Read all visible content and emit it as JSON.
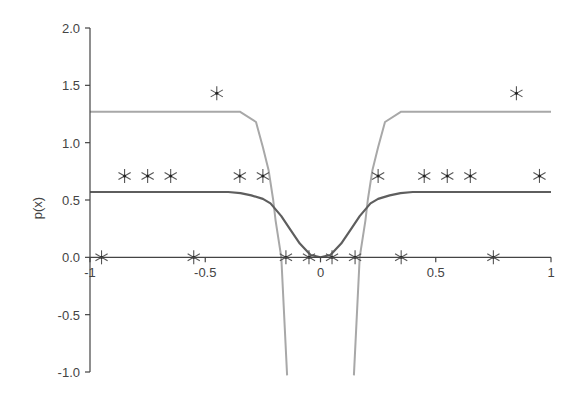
{
  "chart_data": {
    "type": "line",
    "title": "",
    "xlabel": "",
    "ylabel": "p(x)",
    "xlim": [
      -1,
      1
    ],
    "ylim": [
      -1,
      2
    ],
    "x_ticks": [
      -1,
      -0.5,
      0,
      0.5,
      1
    ],
    "x_tick_labels": [
      "-1",
      "-0.5",
      "0",
      "0.5",
      "1"
    ],
    "y_ticks": [
      2.0,
      1.5,
      1.0,
      0.5,
      0.0,
      -0.5,
      -1.0
    ],
    "y_tick_labels": [
      "2.0",
      "1.5",
      "1.0",
      "0.5",
      "0.0",
      "-0.5",
      "-1.0"
    ],
    "grid": false,
    "legend": null,
    "series": [
      {
        "name": "light-curve",
        "kind": "line",
        "color": "#a8a8a8",
        "symmetric": true,
        "note": "two branches mirrored about x=0, plunging below -1",
        "x": [
          -1,
          -0.35,
          -0.28,
          -0.25,
          -0.225,
          -0.205,
          -0.195,
          -0.17,
          -0.145
        ],
        "y": [
          1.27,
          1.27,
          1.18,
          0.96,
          0.76,
          0.5,
          0.32,
          0.0,
          -1.03
        ]
      },
      {
        "name": "dark-curve",
        "kind": "line",
        "color": "#5e5e5e",
        "symmetric": true,
        "x": [
          -1,
          -0.4,
          -0.347,
          -0.3,
          -0.25,
          -0.217,
          -0.17,
          -0.13,
          -0.09,
          -0.043,
          0
        ],
        "y": [
          0.57,
          0.57,
          0.56,
          0.54,
          0.51,
          0.47,
          0.36,
          0.24,
          0.12,
          0.02,
          0.0
        ]
      },
      {
        "name": "samples",
        "kind": "scatter",
        "marker": "asterisk",
        "color": "#555555",
        "x": [
          -0.95,
          -0.55,
          -0.15,
          -0.05,
          0.05,
          0.15,
          0.35,
          0.75,
          -0.85,
          -0.75,
          -0.65,
          -0.35,
          -0.25,
          0.25,
          0.45,
          0.55,
          0.65,
          0.95,
          -0.45,
          0.85
        ],
        "y": [
          0,
          0,
          0,
          0,
          0,
          0,
          0,
          0,
          0.71,
          0.71,
          0.71,
          0.71,
          0.71,
          0.71,
          0.71,
          0.71,
          0.71,
          0.71,
          1.43,
          1.43
        ]
      }
    ]
  },
  "layout": {
    "x0_px": 90,
    "x1_px": 551,
    "y_top_px": 28,
    "y_bottom_px": 372
  }
}
